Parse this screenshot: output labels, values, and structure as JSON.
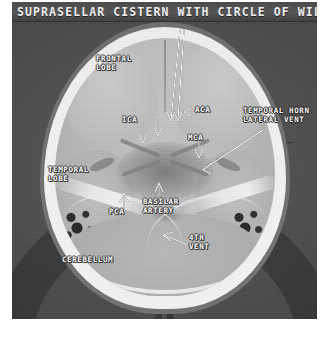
{
  "title": "SUPRASELLAR CISTERN WITH CIRCLE OF WILLIS",
  "image": {
    "modality": "CT",
    "view": "axial-brain-window",
    "colors": {
      "background": "#4d4d4d",
      "title_band": "#4a4a4a",
      "title_text": "#f2f2f2",
      "bone": "#efefef",
      "brain": "#bcbcbc",
      "csf": "#8b8b8b",
      "annotation": "#fbfbfb"
    }
  },
  "annotations": [
    {
      "id": "frontal-lobe",
      "text": "FRONTAL\nLOBE",
      "marker": "none"
    },
    {
      "id": "aca",
      "text": "ACA",
      "marker": "arrow-left"
    },
    {
      "id": "ica",
      "text": "ICA",
      "marker": "arrow-down"
    },
    {
      "id": "mca",
      "text": "MCA",
      "marker": "arrow-down"
    },
    {
      "id": "temporal-horn",
      "text": "TEMPORAL HORN\nLATERAL VENT",
      "marker": "arrow-leader"
    },
    {
      "id": "temporal-lobe",
      "text": "TEMPORAL\nLOBE",
      "marker": "none"
    },
    {
      "id": "pca",
      "text": "PCA",
      "marker": "arrow-up"
    },
    {
      "id": "basilar-artery",
      "text": "BASILAR\nARTERY",
      "marker": "arrow-up"
    },
    {
      "id": "cerebellum",
      "text": "CEREBELLUM",
      "marker": "none"
    },
    {
      "id": "fourth-vent",
      "text": "4TH\nVENT",
      "marker": "arrow-upleft"
    }
  ]
}
